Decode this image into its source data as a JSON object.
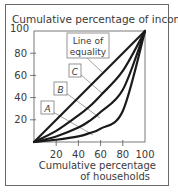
{
  "chart_data": {
    "type": "line",
    "title": "Cumulative percentage of income",
    "ylabel": "Cumulative percentage of income",
    "xlabel_lines": [
      "Cumulative percentage",
      "of households"
    ],
    "xlim": [
      0,
      100
    ],
    "ylim": [
      0,
      100
    ],
    "x_ticks": [
      20,
      40,
      60,
      80,
      100
    ],
    "y_ticks": [
      20,
      40,
      60,
      80,
      100
    ],
    "grid": false,
    "legend": "none (inline boxed labels with leader lines)",
    "series": [
      {
        "name": "Line of equality",
        "x": [
          0,
          100
        ],
        "y": [
          0,
          100
        ]
      },
      {
        "name": "C",
        "x": [
          0,
          20,
          40,
          50,
          60,
          80,
          100
        ],
        "y": [
          0,
          10,
          24,
          32,
          42,
          64,
          100
        ]
      },
      {
        "name": "B",
        "x": [
          0,
          20,
          40,
          50,
          60,
          80,
          100
        ],
        "y": [
          0,
          5,
          13,
          19,
          27,
          47,
          100
        ]
      },
      {
        "name": "A",
        "x": [
          0,
          20,
          40,
          50,
          60,
          80,
          100
        ],
        "y": [
          0,
          2,
          5,
          8,
          12,
          28,
          100
        ]
      }
    ],
    "annotations": [
      {
        "text": "Line of equality",
        "lines": [
          "Line of",
          "equality"
        ],
        "points_to": "Line of equality"
      },
      {
        "text": "C",
        "points_to": "C"
      },
      {
        "text": "B",
        "points_to": "B"
      },
      {
        "text": "A",
        "points_to": "A"
      }
    ]
  },
  "colors": {
    "curve": "#1a1a1a",
    "frame": "#6a6a6a",
    "leader": "#8a8a8a",
    "text": "#3a3a3a"
  }
}
